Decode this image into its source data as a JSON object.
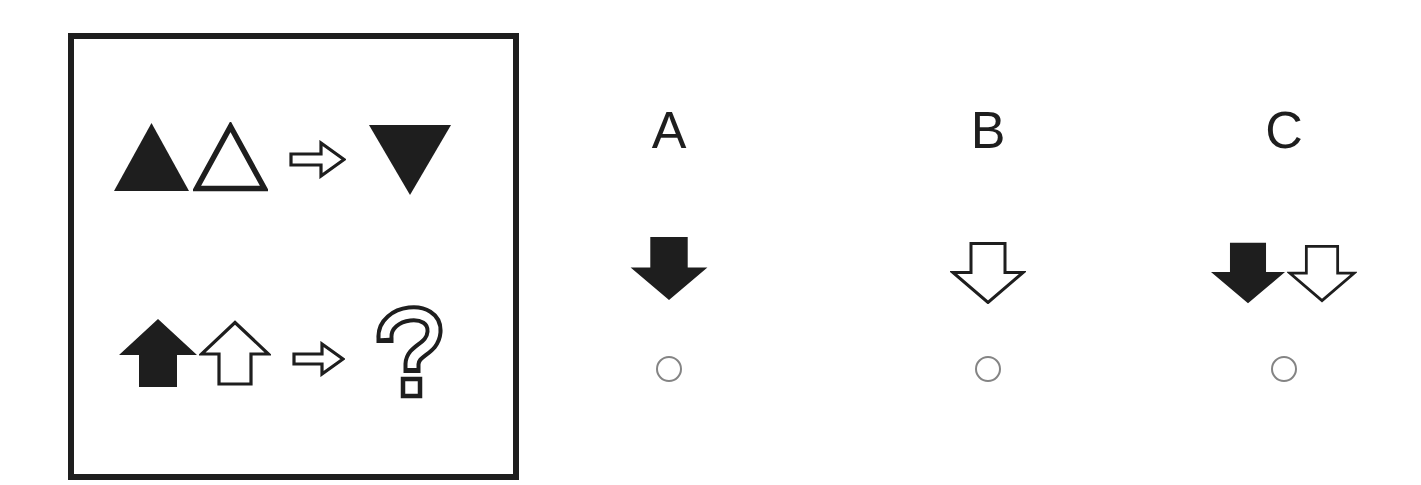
{
  "colors": {
    "ink": "#1e1e1e",
    "paper": "#ffffff",
    "radio-ring": "#848484"
  },
  "stimulus": {
    "rows": [
      {
        "name": "example-row",
        "shapes": [
          "triangle-up-filled",
          "triangle-up-outline",
          "arrow-right-outline",
          "triangle-down-filled"
        ]
      },
      {
        "name": "question-row",
        "shapes": [
          "arrow-up-filled",
          "arrow-up-outline",
          "arrow-right-outline",
          "question-mark-outline"
        ]
      }
    ]
  },
  "options": [
    {
      "label": "A",
      "shapes": [
        "arrow-down-filled"
      ],
      "selected": false
    },
    {
      "label": "B",
      "shapes": [
        "arrow-down-outline"
      ],
      "selected": false
    },
    {
      "label": "C",
      "shapes": [
        "arrow-down-filled",
        "arrow-down-outline"
      ],
      "selected": false
    }
  ]
}
